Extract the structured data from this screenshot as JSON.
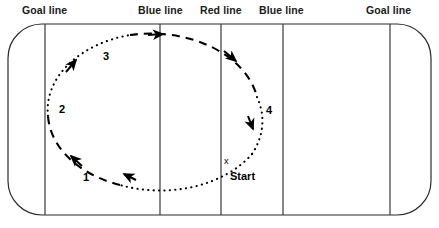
{
  "diagram": {
    "line_labels": [
      {
        "id": "goal-line-left",
        "text": "Goal line",
        "x": 22,
        "y": 4
      },
      {
        "id": "blue-line-left",
        "text": "Blue line",
        "x": 138,
        "y": 4
      },
      {
        "id": "red-line",
        "text": "Red line",
        "x": 200,
        "y": 4
      },
      {
        "id": "blue-line-right",
        "text": "Blue line",
        "x": 259,
        "y": 4
      },
      {
        "id": "goal-line-right",
        "text": "Goal line",
        "x": 366,
        "y": 4
      }
    ],
    "rink": {
      "left": 8,
      "top": 24,
      "right": 431,
      "bottom": 215,
      "corner_radius": 34,
      "stroke_color": "#2b2b2b",
      "stroke_width": 1.2,
      "fill_color": "#ffffff"
    },
    "vertical_lines": [
      {
        "id": "goal-line-left-mark",
        "x": 45,
        "color": "#3a3a3a"
      },
      {
        "id": "blue-line-left-mark",
        "x": 160,
        "color": "#3a3a3a"
      },
      {
        "id": "red-line-mark",
        "x": 221,
        "color": "#3a3a3a"
      },
      {
        "id": "blue-line-right-mark",
        "x": 283,
        "color": "#3a3a3a"
      },
      {
        "id": "goal-line-right-mark",
        "x": 390,
        "color": "#3a3a3a"
      }
    ],
    "path": {
      "shape": "ellipse",
      "center_x": 155,
      "center_y": 110,
      "radius_x": 108,
      "radius_y": 77,
      "direction": "counterclockwise",
      "stroke_color": "#000000",
      "stroke_width": 2.1,
      "segments": [
        {
          "id": "segment-1-dotted",
          "style": "dotted",
          "description": "Start to bottom-left, dotted"
        },
        {
          "id": "segment-2-dashed",
          "style": "dashed",
          "description": "Left side upward, dashed"
        },
        {
          "id": "segment-3-dotted",
          "style": "dotted",
          "description": "Upper-left across top, dotted"
        },
        {
          "id": "segment-4-dashed",
          "style": "dashed",
          "description": "Top to right side, dashed"
        },
        {
          "id": "segment-5-dotted",
          "style": "dotted",
          "description": "Right side down to Start, dotted"
        }
      ]
    },
    "step_labels": [
      {
        "id": "step-1",
        "text": "1",
        "x": 83,
        "y": 172
      },
      {
        "id": "step-2",
        "text": "2",
        "x": 59,
        "y": 104
      },
      {
        "id": "step-3",
        "text": "3",
        "x": 103,
        "y": 51
      },
      {
        "id": "step-4",
        "text": "4",
        "x": 266,
        "y": 105
      }
    ],
    "start_marker": {
      "id": "start-marker",
      "x_glyph": "x",
      "x_glyph_x": 224,
      "x_glyph_y": 157,
      "label": "Start",
      "label_x": 230,
      "label_y": 171
    },
    "arrows": [
      {
        "id": "arrow-bottom-left",
        "x": 124,
        "y": 172,
        "angle": 200
      },
      {
        "id": "arrow-left-lower",
        "x": 72,
        "y": 158,
        "angle": 250
      },
      {
        "id": "arrow-upper-left",
        "x": 76,
        "y": 60,
        "angle": 315
      },
      {
        "id": "arrow-top",
        "x": 160,
        "y": 35,
        "angle": 2
      },
      {
        "id": "arrow-upper-right",
        "x": 235,
        "y": 60,
        "angle": 50
      },
      {
        "id": "arrow-right-lower",
        "x": 253,
        "y": 128,
        "angle": 100
      }
    ],
    "colors": {
      "ink": "#000000",
      "rink_stroke": "#2b2b2b",
      "divider_stroke": "#3a3a3a",
      "background": "#ffffff"
    }
  }
}
